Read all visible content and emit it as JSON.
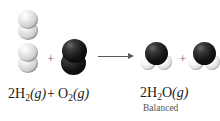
{
  "figure": {
    "type": "chemical-reaction-diagram",
    "caption": "Balanced chemical equation for the formation of water from hydrogen and oxygen gas",
    "background_color": "#ffffff"
  },
  "model_row": {
    "reactants": [
      {
        "id": "hydrogen-molecule-1",
        "formula": "H2",
        "name": "hydrogen-molecule",
        "atoms": [
          {
            "element": "H",
            "color": "#d2d2d2"
          },
          {
            "element": "H",
            "color": "#d2d2d2"
          }
        ]
      },
      {
        "id": "hydrogen-molecule-2",
        "formula": "H2",
        "name": "hydrogen-molecule",
        "atoms": [
          {
            "element": "H",
            "color": "#d2d2d2"
          },
          {
            "element": "H",
            "color": "#d2d2d2"
          }
        ]
      },
      {
        "id": "oxygen-molecule-1",
        "formula": "O2",
        "name": "oxygen-molecule",
        "atoms": [
          {
            "element": "O",
            "color": "#141414"
          },
          {
            "element": "O",
            "color": "#141414"
          }
        ]
      }
    ],
    "products": [
      {
        "id": "water-molecule-1",
        "formula": "H2O",
        "name": "water-molecule",
        "atoms": [
          {
            "element": "O",
            "color": "#141414"
          },
          {
            "element": "H",
            "color": "#ffffff"
          },
          {
            "element": "H",
            "color": "#ffffff"
          }
        ]
      },
      {
        "id": "water-molecule-2",
        "formula": "H2O",
        "name": "water-molecule",
        "atoms": [
          {
            "element": "O",
            "color": "#141414"
          },
          {
            "element": "H",
            "color": "#ffffff"
          },
          {
            "element": "H",
            "color": "#ffffff"
          }
        ]
      }
    ],
    "plus_reactants": "+",
    "plus_products": "+",
    "arrow": "yields-arrow-right"
  },
  "equation": {
    "reactant_1": {
      "coefficient": "2",
      "formula": "H",
      "subscript": "2",
      "state": "(g)"
    },
    "plus": "+",
    "reactant_2": {
      "coefficient": "",
      "formula": "O",
      "subscript": "2",
      "state": "(g)"
    },
    "arrow": "yields-arrow-right",
    "product": {
      "coefficient": "2",
      "formula_a": "H",
      "subscript": "2",
      "formula_b": "O",
      "state": "(g)"
    },
    "balanced_label": "Balanced",
    "text_color": "#1c1c1c",
    "label_color": "#555555"
  }
}
